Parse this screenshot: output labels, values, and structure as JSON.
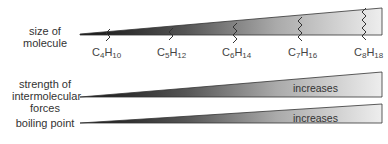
{
  "labels": {
    "size": [
      "size of",
      "molecule"
    ],
    "strength": [
      "strength of",
      "intermolecular",
      "forces"
    ],
    "boiling": [
      "boiling point"
    ]
  },
  "molecules": [
    {
      "c": "C",
      "cn": "4",
      "h": "H",
      "hn": "10"
    },
    {
      "c": "C",
      "cn": "5",
      "h": "H",
      "hn": "12"
    },
    {
      "c": "C",
      "cn": "6",
      "h": "H",
      "hn": "14"
    },
    {
      "c": "C",
      "cn": "7",
      "h": "H",
      "hn": "16"
    },
    {
      "c": "C",
      "cn": "8",
      "h": "H",
      "hn": "18"
    }
  ],
  "wedges": {
    "strength_text": "increases",
    "boiling_text": "increases"
  },
  "colors": {
    "dark": "#1a1a1a",
    "light": "#ececec",
    "stroke": "#333333"
  }
}
